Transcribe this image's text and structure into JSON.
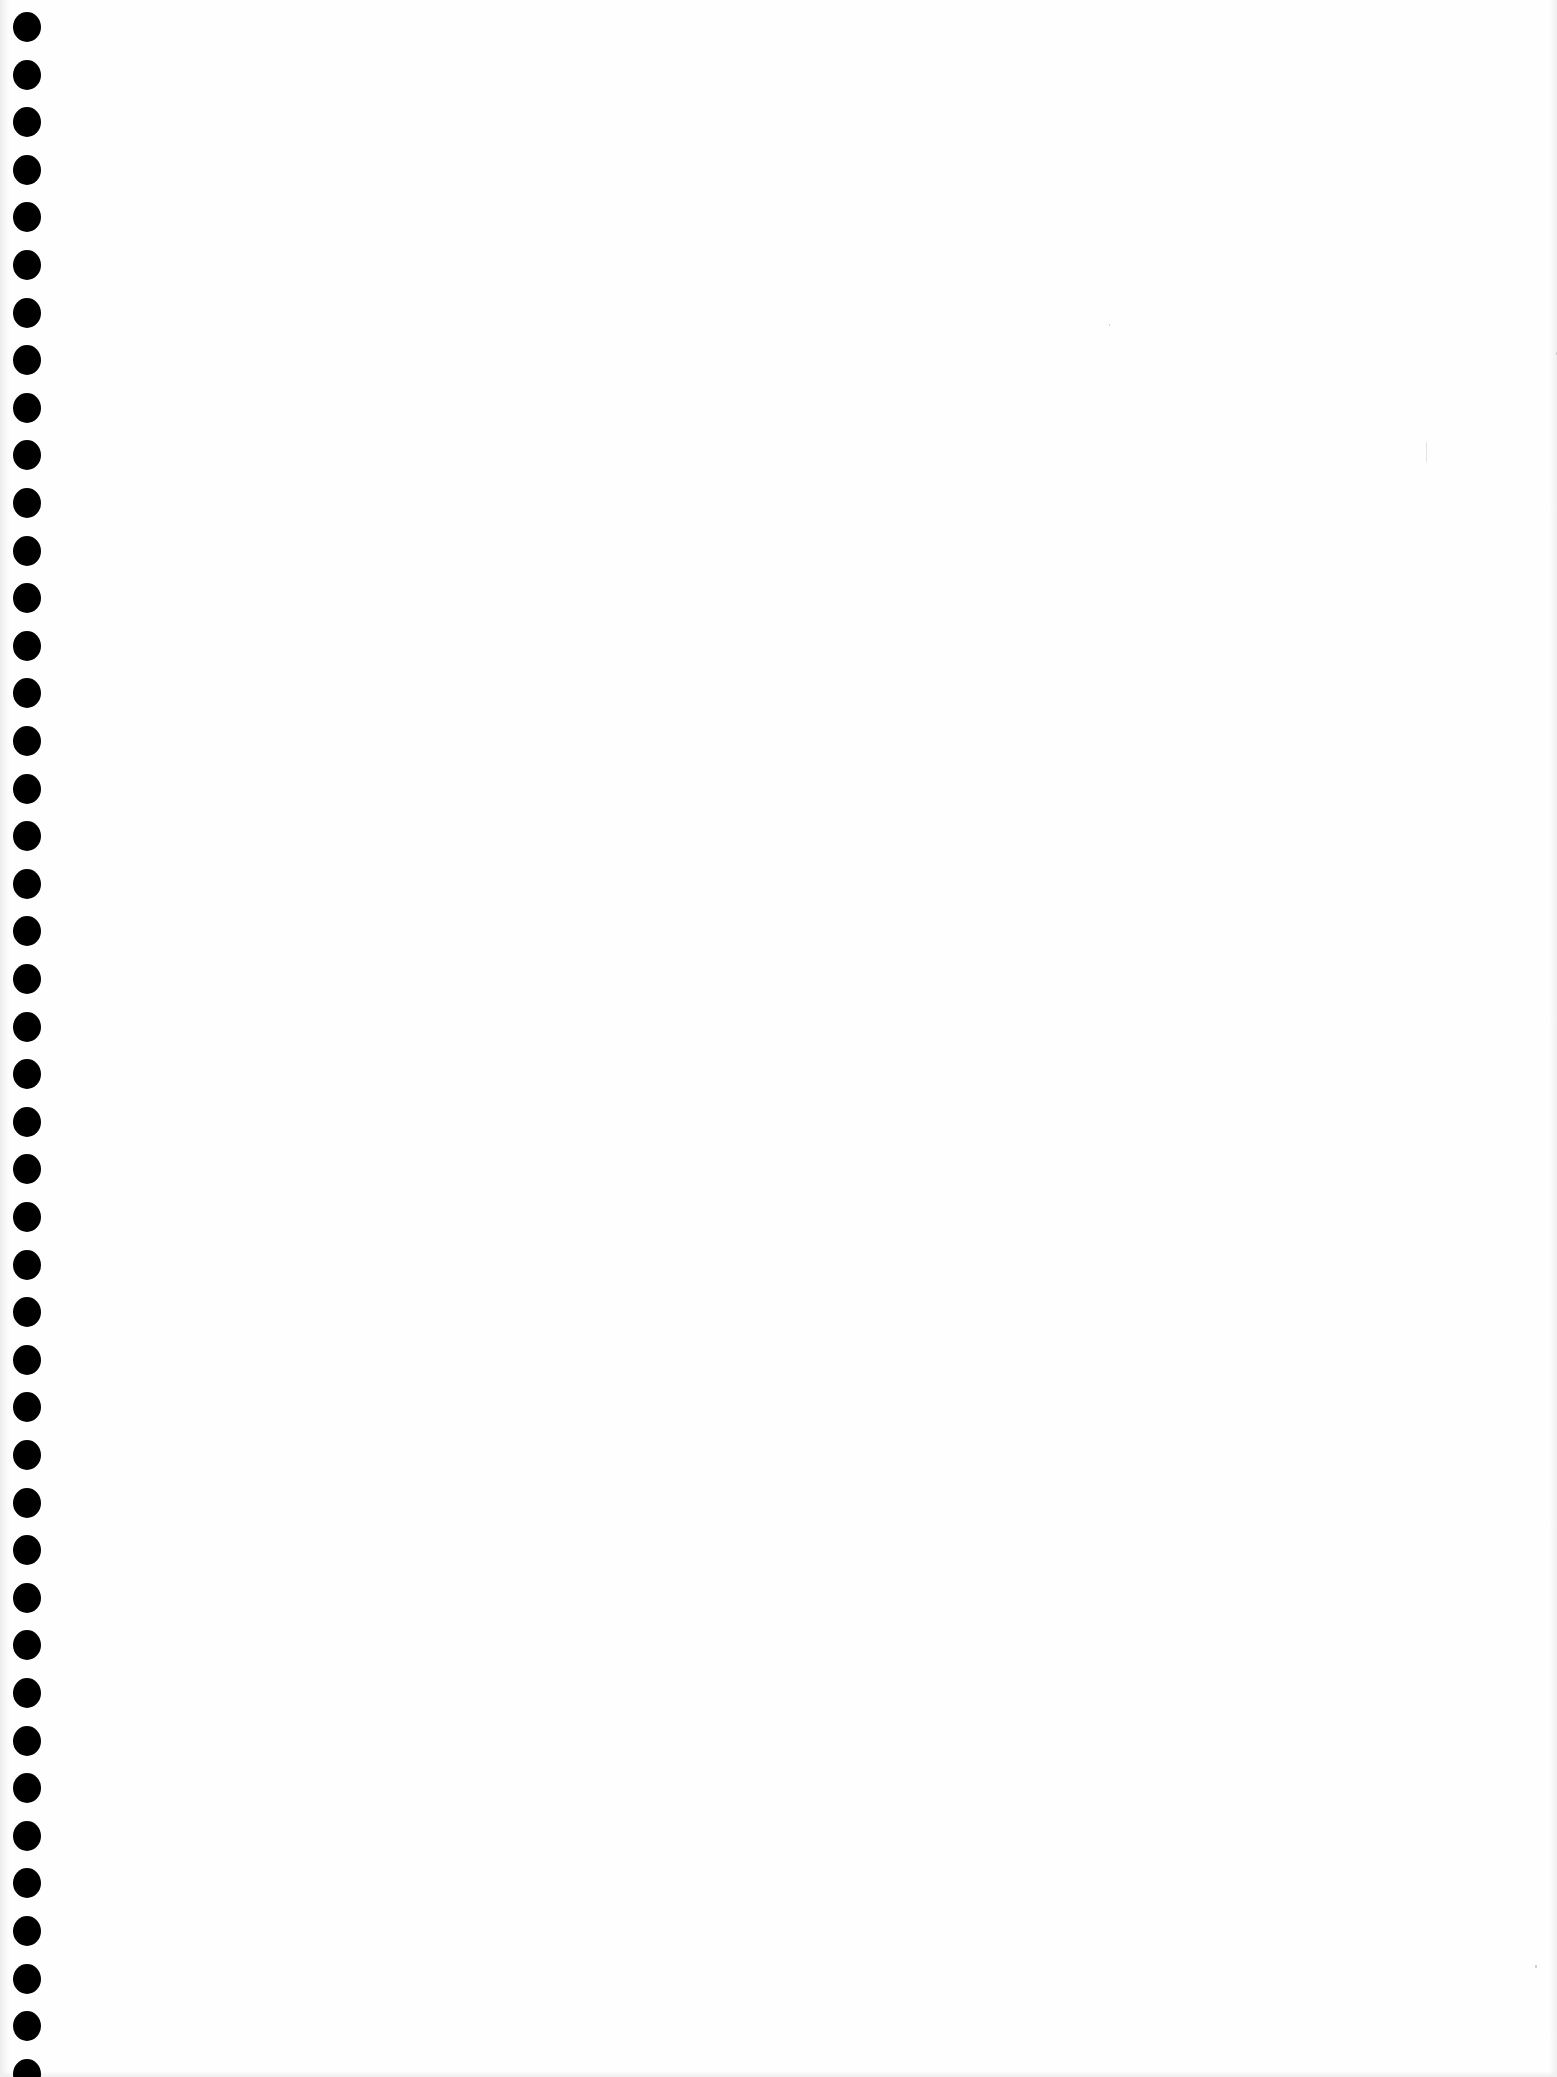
{
  "page": {
    "type": "blank notebook page",
    "background_color": "#ffffff",
    "content_text": ""
  },
  "binding": {
    "style": "spiral-punched holes",
    "hole_color": "#000000",
    "hole_count": 44,
    "first_hole_center_y": 27,
    "spacing_px": 47.6
  }
}
